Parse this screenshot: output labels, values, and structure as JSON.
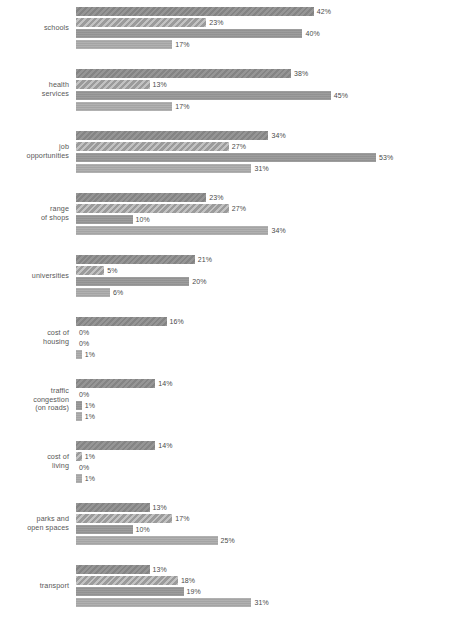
{
  "chart_data": {
    "type": "bar",
    "orientation": "horizontal",
    "title": "",
    "subtitle": "",
    "xlabel": "",
    "ylabel": "",
    "xlim": [
      0,
      53
    ],
    "grid": false,
    "legend": "none",
    "value_suffix": "%",
    "categories": [
      "schools",
      "health\nservices",
      "job\nopportunities",
      "range\nof shops",
      "universities",
      "cost of\nhousing",
      "traffic\ncongestion\n(on roads)",
      "cost of\nliving",
      "parks and\nopen spaces",
      "transport"
    ],
    "series": [
      {
        "name": "series-1",
        "values": [
          42,
          38,
          34,
          23,
          21,
          16,
          14,
          14,
          13,
          13
        ]
      },
      {
        "name": "series-2",
        "values": [
          23,
          13,
          27,
          27,
          5,
          0,
          0,
          1,
          17,
          18
        ]
      },
      {
        "name": "series-3",
        "values": [
          40,
          45,
          53,
          10,
          20,
          0,
          1,
          0,
          10,
          19
        ]
      },
      {
        "name": "series-4",
        "values": [
          17,
          17,
          31,
          34,
          6,
          1,
          1,
          1,
          25,
          31
        ]
      }
    ],
    "labels": [
      [
        "42%",
        "23%",
        "40%",
        "17%"
      ],
      [
        "38%",
        "13%",
        "45%",
        "17%"
      ],
      [
        "34%",
        "27%",
        "53%",
        "31%"
      ],
      [
        "23%",
        "27%",
        "10%",
        "34%"
      ],
      [
        "21%",
        "5%",
        "20%",
        "6%"
      ],
      [
        "16%",
        "0%",
        "0%",
        "1%"
      ],
      [
        "14%",
        "0%",
        "1%",
        "1%"
      ],
      [
        "14%",
        "1%",
        "0%",
        "1%"
      ],
      [
        "13%",
        "17%",
        "10%",
        "25%"
      ],
      [
        "13%",
        "18%",
        "19%",
        "31%"
      ]
    ],
    "colors": {
      "series_1": "#8a8a8a",
      "series_2": "#a3a3a3",
      "series_3": "#969696",
      "series_4": "#a8a8a8",
      "background": "#ffffff",
      "text": "#4a4a4a"
    }
  }
}
